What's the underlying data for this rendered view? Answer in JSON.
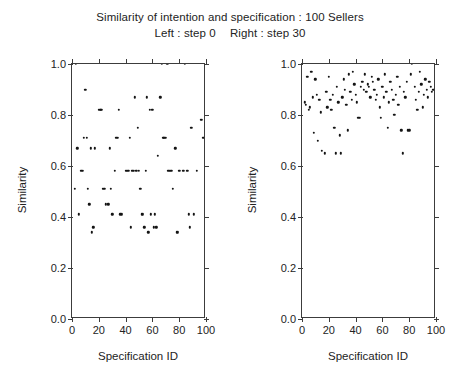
{
  "figure": {
    "title_line_1": "Similarity of intention and specification : 100 Sellers",
    "title_line_2_left": "Left : step 0",
    "title_line_2_right": "Right : step 30",
    "point_color": "#141414",
    "axis_color": "#3c3c3c",
    "background": "#ffffff"
  },
  "chart_data": [
    {
      "type": "scatter",
      "panel": "left",
      "title": "Left : step 0",
      "xlabel": "Specification ID",
      "ylabel": "Similarity",
      "xlim": [
        0,
        100
      ],
      "ylim": [
        0.0,
        1.0
      ],
      "xticks": [
        0,
        20,
        40,
        60,
        80,
        100
      ],
      "yticks": [
        0.0,
        0.2,
        0.4,
        0.6,
        0.8,
        1.0
      ],
      "xtick_labels": [
        "0",
        "20",
        "40",
        "60",
        "80",
        "100"
      ],
      "ytick_labels": [
        "0.0",
        "0.2",
        "0.4",
        "0.6",
        "0.8",
        "1.0"
      ],
      "grid": false,
      "legend": false,
      "marker": "filled-circle",
      "n_points": 100,
      "x": [
        1,
        2,
        3,
        4,
        5,
        6,
        7,
        8,
        9,
        10,
        11,
        12,
        13,
        14,
        15,
        16,
        17,
        18,
        19,
        20,
        21,
        22,
        23,
        24,
        25,
        26,
        27,
        28,
        29,
        30,
        31,
        32,
        33,
        34,
        35,
        36,
        37,
        38,
        39,
        40,
        41,
        42,
        43,
        44,
        45,
        46,
        47,
        48,
        49,
        50,
        51,
        52,
        53,
        54,
        55,
        56,
        57,
        58,
        59,
        60,
        61,
        62,
        63,
        64,
        65,
        66,
        67,
        68,
        69,
        70,
        71,
        72,
        73,
        74,
        75,
        76,
        77,
        78,
        79,
        80,
        81,
        82,
        83,
        84,
        85,
        86,
        87,
        88,
        89,
        90,
        91,
        92,
        93,
        94,
        95,
        96,
        97,
        98,
        99,
        100
      ],
      "y": [
        0.0,
        0.51,
        1.0,
        0.67,
        0.41,
        0.0,
        0.58,
        0.58,
        0.71,
        0.9,
        0.71,
        0.51,
        0.45,
        0.67,
        0.34,
        0.36,
        0.67,
        0.0,
        0.0,
        0.82,
        0.82,
        0.82,
        0.51,
        0.51,
        0.45,
        0.0,
        0.45,
        0.67,
        0.51,
        0.41,
        0.0,
        0.58,
        0.71,
        0.71,
        0.82,
        0.41,
        0.41,
        0.0,
        0.0,
        0.58,
        0.58,
        0.58,
        0.71,
        0.36,
        0.58,
        0.58,
        0.87,
        0.58,
        0.75,
        0.58,
        0.51,
        0.41,
        0.41,
        0.36,
        0.58,
        0.87,
        0.34,
        0.82,
        0.41,
        0.82,
        0.36,
        0.41,
        0.36,
        0.64,
        0.0,
        0.87,
        1.0,
        0.71,
        0.71,
        0.71,
        1.0,
        0.58,
        0.58,
        0.58,
        0.51,
        0.0,
        0.67,
        0.34,
        0.34,
        0.58,
        0.0,
        0.0,
        0.58,
        1.0,
        0.0,
        0.58,
        0.41,
        0.36,
        0.75,
        0.0,
        0.41,
        0.0,
        0.58,
        0.0,
        0.0,
        0.78,
        0.78,
        0.71,
        0.0,
        0.0
      ]
    },
    {
      "type": "scatter",
      "panel": "right",
      "title": "Right : step 30",
      "xlabel": "Specification ID",
      "ylabel": "Similarity",
      "xlim": [
        0,
        100
      ],
      "ylim": [
        0.0,
        1.0
      ],
      "xticks": [
        0,
        20,
        40,
        60,
        80,
        100
      ],
      "yticks": [
        0.0,
        0.2,
        0.4,
        0.6,
        0.8,
        1.0
      ],
      "xtick_labels": [
        "0",
        "20",
        "40",
        "60",
        "80",
        "100"
      ],
      "ytick_labels": [
        "0.0",
        "0.2",
        "0.4",
        "0.6",
        "0.8",
        "1.0"
      ],
      "grid": false,
      "legend": false,
      "marker": "filled-circle",
      "n_points": 100,
      "x": [
        1,
        2,
        3,
        4,
        5,
        6,
        7,
        8,
        9,
        10,
        11,
        12,
        13,
        14,
        15,
        16,
        17,
        18,
        19,
        20,
        21,
        22,
        23,
        24,
        25,
        26,
        27,
        28,
        29,
        30,
        31,
        32,
        33,
        34,
        35,
        36,
        37,
        38,
        39,
        40,
        41,
        42,
        43,
        44,
        45,
        46,
        47,
        48,
        49,
        50,
        51,
        52,
        53,
        54,
        55,
        56,
        57,
        58,
        59,
        60,
        61,
        62,
        63,
        64,
        65,
        66,
        67,
        68,
        69,
        70,
        71,
        72,
        73,
        74,
        75,
        76,
        77,
        78,
        79,
        80,
        81,
        82,
        83,
        84,
        85,
        86,
        87,
        88,
        89,
        90,
        91,
        92,
        93,
        94,
        95,
        96,
        97,
        98,
        99,
        100
      ],
      "y": [
        0.0,
        0.85,
        0.84,
        0.95,
        0.82,
        0.83,
        0.97,
        0.87,
        0.73,
        0.94,
        0.88,
        0.7,
        0.86,
        0.81,
        0.66,
        0.0,
        0.65,
        0.89,
        0.83,
        0.95,
        0.86,
        0.82,
        0.88,
        0.75,
        0.65,
        0.91,
        0.85,
        0.72,
        0.65,
        0.87,
        0.94,
        0.9,
        0.84,
        0.74,
        0.96,
        0.89,
        0.86,
        0.97,
        0.92,
        0.88,
        0.85,
        0.79,
        0.79,
        0.91,
        0.93,
        0.9,
        0.96,
        0.89,
        0.92,
        0.91,
        0.87,
        0.95,
        0.93,
        0.9,
        0.86,
        0.88,
        0.94,
        0.83,
        0.79,
        0.91,
        0.87,
        0.96,
        0.89,
        0.75,
        0.85,
        0.93,
        0.9,
        0.86,
        0.8,
        0.88,
        0.95,
        0.84,
        0.91,
        0.74,
        0.65,
        0.89,
        0.87,
        0.93,
        0.74,
        0.74,
        0.96,
        1.0,
        0.0,
        0.91,
        0.86,
        0.82,
        0.89,
        0.97,
        0.92,
        0.83,
        0.88,
        0.94,
        0.9,
        0.87,
        0.93,
        0.91,
        0.89,
        0.9,
        0.0,
        0.89
      ]
    }
  ]
}
